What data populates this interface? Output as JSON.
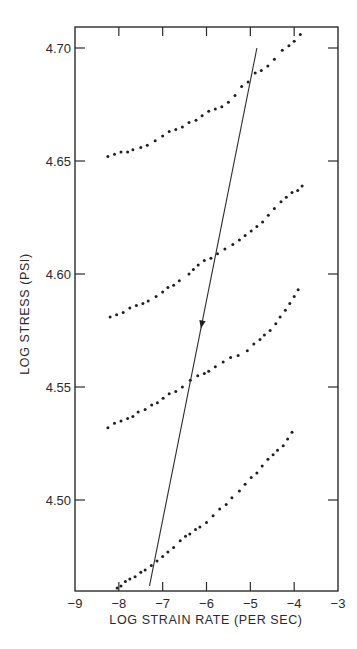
{
  "chart_data": {
    "type": "scatter",
    "title": "",
    "xlabel": "LOG STRAIN RATE (PER SEC)",
    "ylabel": "LOG STRESS (PSI)",
    "xlim": [
      -9,
      -3
    ],
    "ylim": [
      4.46,
      4.71
    ],
    "grid": false,
    "legend": null,
    "x_ticks": [
      -9,
      -8,
      -7,
      -6,
      -5,
      -4,
      -3
    ],
    "x_tick_labels": [
      "−9",
      "−8",
      "−7",
      "−6",
      "−5",
      "−4",
      "−3"
    ],
    "y_ticks": [
      4.5,
      4.55,
      4.6,
      4.65,
      4.7
    ],
    "y_tick_labels": [
      "4.50",
      "4.55",
      "4.60",
      "4.65",
      "4.70"
    ],
    "series": [
      {
        "name": "curve-1",
        "points": [
          [
            -8.25,
            4.652
          ],
          [
            -8.1,
            4.653
          ],
          [
            -7.95,
            4.654
          ],
          [
            -7.8,
            4.654
          ],
          [
            -7.68,
            4.655
          ],
          [
            -7.5,
            4.656
          ],
          [
            -7.35,
            4.657
          ],
          [
            -7.17,
            4.659
          ],
          [
            -7.0,
            4.661
          ],
          [
            -6.85,
            4.663
          ],
          [
            -6.7,
            4.664
          ],
          [
            -6.55,
            4.665
          ],
          [
            -6.4,
            4.667
          ],
          [
            -6.24,
            4.668
          ],
          [
            -6.1,
            4.67
          ],
          [
            -5.95,
            4.672
          ],
          [
            -5.8,
            4.673
          ],
          [
            -5.65,
            4.674
          ],
          [
            -5.5,
            4.676
          ],
          [
            -5.35,
            4.679
          ],
          [
            -5.2,
            4.683
          ],
          [
            -5.05,
            4.685
          ],
          [
            -4.89,
            4.689
          ],
          [
            -4.75,
            4.69
          ],
          [
            -4.6,
            4.692
          ],
          [
            -4.45,
            4.695
          ],
          [
            -4.27,
            4.699
          ],
          [
            -4.12,
            4.701
          ],
          [
            -4.0,
            4.703
          ],
          [
            -3.86,
            4.706
          ]
        ]
      },
      {
        "name": "curve-2",
        "points": [
          [
            -8.2,
            4.581
          ],
          [
            -8.05,
            4.582
          ],
          [
            -7.9,
            4.583
          ],
          [
            -7.75,
            4.585
          ],
          [
            -7.6,
            4.586
          ],
          [
            -7.45,
            4.587
          ],
          [
            -7.33,
            4.588
          ],
          [
            -7.15,
            4.59
          ],
          [
            -7.0,
            4.592
          ],
          [
            -6.88,
            4.594
          ],
          [
            -6.75,
            4.595
          ],
          [
            -6.62,
            4.597
          ],
          [
            -6.4,
            4.6
          ],
          [
            -6.3,
            4.602
          ],
          [
            -6.19,
            4.604
          ],
          [
            -6.05,
            4.606
          ],
          [
            -5.9,
            4.607
          ],
          [
            -5.75,
            4.609
          ],
          [
            -5.58,
            4.611
          ],
          [
            -5.4,
            4.613
          ],
          [
            -5.25,
            4.615
          ],
          [
            -5.12,
            4.617
          ],
          [
            -4.98,
            4.619
          ],
          [
            -4.85,
            4.621
          ],
          [
            -4.72,
            4.623
          ],
          [
            -4.59,
            4.626
          ],
          [
            -4.45,
            4.629
          ],
          [
            -4.3,
            4.632
          ],
          [
            -4.18,
            4.634
          ],
          [
            -4.05,
            4.636
          ],
          [
            -3.92,
            4.637
          ],
          [
            -3.82,
            4.639
          ]
        ]
      },
      {
        "name": "curve-3",
        "points": [
          [
            -8.25,
            4.532
          ],
          [
            -8.1,
            4.534
          ],
          [
            -7.95,
            4.535
          ],
          [
            -7.8,
            4.536
          ],
          [
            -7.68,
            4.537
          ],
          [
            -7.56,
            4.539
          ],
          [
            -7.4,
            4.54
          ],
          [
            -7.25,
            4.542
          ],
          [
            -7.12,
            4.543
          ],
          [
            -6.99,
            4.545
          ],
          [
            -6.85,
            4.547
          ],
          [
            -6.7,
            4.548
          ],
          [
            -6.55,
            4.55
          ],
          [
            -6.37,
            4.553
          ],
          [
            -6.2,
            4.555
          ],
          [
            -6.05,
            4.556
          ],
          [
            -5.95,
            4.557
          ],
          [
            -5.8,
            4.559
          ],
          [
            -5.62,
            4.561
          ],
          [
            -5.45,
            4.563
          ],
          [
            -5.28,
            4.564
          ],
          [
            -5.07,
            4.566
          ],
          [
            -4.92,
            4.569
          ],
          [
            -4.78,
            4.571
          ],
          [
            -4.68,
            4.573
          ],
          [
            -4.55,
            4.575
          ],
          [
            -4.42,
            4.578
          ],
          [
            -4.32,
            4.581
          ],
          [
            -4.2,
            4.584
          ],
          [
            -4.1,
            4.587
          ],
          [
            -4.0,
            4.59
          ],
          [
            -3.91,
            4.593
          ]
        ]
      },
      {
        "name": "curve-4",
        "points": [
          [
            -8.04,
            4.461
          ],
          [
            -7.95,
            4.462
          ],
          [
            -7.85,
            4.464
          ],
          [
            -7.75,
            4.465
          ],
          [
            -7.63,
            4.466
          ],
          [
            -7.5,
            4.468
          ],
          [
            -7.4,
            4.469
          ],
          [
            -7.26,
            4.471
          ],
          [
            -7.13,
            4.473
          ],
          [
            -7.0,
            4.475
          ],
          [
            -6.88,
            4.477
          ],
          [
            -6.75,
            4.479
          ],
          [
            -6.6,
            4.482
          ],
          [
            -6.48,
            4.484
          ],
          [
            -6.38,
            4.485
          ],
          [
            -6.25,
            4.487
          ],
          [
            -6.15,
            4.488
          ],
          [
            -6.0,
            4.49
          ],
          [
            -5.85,
            4.493
          ],
          [
            -5.7,
            4.496
          ],
          [
            -5.55,
            4.498
          ],
          [
            -5.42,
            4.501
          ],
          [
            -5.25,
            4.504
          ],
          [
            -5.12,
            4.507
          ],
          [
            -4.98,
            4.51
          ],
          [
            -4.85,
            4.512
          ],
          [
            -4.73,
            4.515
          ],
          [
            -4.6,
            4.518
          ],
          [
            -4.48,
            4.52
          ],
          [
            -4.38,
            4.522
          ],
          [
            -4.25,
            4.524
          ],
          [
            -4.15,
            4.527
          ],
          [
            -4.05,
            4.53
          ]
        ]
      }
    ],
    "annotations": [
      {
        "type": "line-with-arrow",
        "description": "straight line crossing all four curves, arrow pointing downward",
        "from": [
          -4.85,
          4.7
        ],
        "to": [
          -7.3,
          4.462
        ],
        "arrow_at": [
          -6.2,
          4.578
        ],
        "arrow_direction": "down"
      }
    ]
  }
}
